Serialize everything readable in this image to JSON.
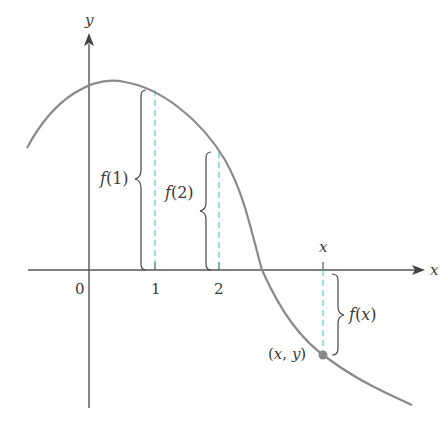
{
  "figure": {
    "colors": {
      "axis": "#555555",
      "curve": "#8a8a8a",
      "dashed": "#5ac8d8",
      "brace": "#444444",
      "point": "#8a8a8a",
      "text": "#3a3a3a"
    },
    "axes": {
      "x_label": "x",
      "y_label": "y",
      "origin_label": "0",
      "ticks": [
        {
          "label": "1"
        },
        {
          "label": "2"
        }
      ],
      "moving_tick_label": "x"
    },
    "annotations": {
      "f1": "f(1)",
      "f2": "f(2)",
      "fx": "f(x)",
      "point": "(x, y)"
    }
  }
}
